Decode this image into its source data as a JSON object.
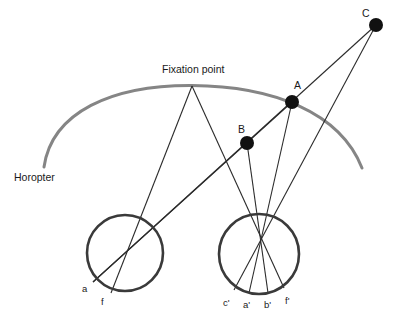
{
  "diagram": {
    "title_labels": {
      "horopter": "Horopter",
      "fixation_point": "Fixation point"
    },
    "object_points": [
      {
        "name": "A",
        "label": "A",
        "x": 292,
        "y": 102,
        "r": 7,
        "label_x": 294,
        "label_y": 89,
        "color": "#111111"
      },
      {
        "name": "B",
        "label": "B",
        "x": 247,
        "y": 143,
        "r": 7,
        "label_x": 238,
        "label_y": 133,
        "color": "#111111"
      },
      {
        "name": "C",
        "label": "C",
        "x": 376,
        "y": 25,
        "r": 7,
        "label_x": 362,
        "label_y": 17,
        "color": "#111111"
      }
    ],
    "retinal_labels_left": [
      {
        "name": "a",
        "label": "a",
        "x": 82,
        "y": 292
      },
      {
        "name": "f",
        "label": "f",
        "x": 101,
        "y": 305
      }
    ],
    "retinal_labels_right": [
      {
        "name": "c-prime",
        "label": "c'",
        "x": 223,
        "y": 306
      },
      {
        "name": "a-prime",
        "label": "a'",
        "x": 243,
        "y": 308
      },
      {
        "name": "b-prime",
        "label": "b'",
        "x": 264,
        "y": 308
      },
      {
        "name": "f-prime",
        "label": "f'",
        "x": 285,
        "y": 304
      }
    ],
    "fixation_label_pos": {
      "x": 162,
      "y": 73
    },
    "horopter_label_pos": {
      "x": 14,
      "y": 181
    },
    "horopter_arc": {
      "path": "M 44,167 C 52,112 112,85 192,85.5 C 272,86 340,112 362,168",
      "color": "#858585",
      "width": 3
    },
    "eyes": [
      {
        "name": "left-eye",
        "cx": 125,
        "cy": 253,
        "r": 38,
        "color": "#3a3a3a",
        "width": 2.6
      },
      {
        "name": "right-eye",
        "cx": 259,
        "cy": 254,
        "r": 40,
        "color": "#3a3a3a",
        "width": 2.6
      }
    ],
    "nodal_points": [
      {
        "name": "left-nodal-point",
        "x": 126,
        "y": 255
      },
      {
        "name": "right-nodal-point",
        "x": 259,
        "y": 256
      }
    ],
    "fixation_point": {
      "x": 192,
      "y": 86
    },
    "rays": [
      {
        "name": "ray-fixation-to-left-eye",
        "x1": 192,
        "y1": 86,
        "x2": 111,
        "y2": 293
      },
      {
        "name": "ray-fixation-to-right-eye",
        "x1": 192,
        "y1": 86,
        "x2": 284,
        "y2": 288
      },
      {
        "name": "ray-A-to-left-eye",
        "x1": 292,
        "y1": 102,
        "x2": 93,
        "y2": 282
      },
      {
        "name": "ray-A-to-right-eye",
        "x1": 292,
        "y1": 102,
        "x2": 249,
        "y2": 293
      },
      {
        "name": "ray-B-to-right-eye",
        "x1": 247,
        "y1": 143,
        "x2": 268,
        "y2": 293
      },
      {
        "name": "ray-C-to-A-and-left-eye",
        "x1": 376,
        "y1": 25,
        "x2": 93,
        "y2": 282
      },
      {
        "name": "ray-C-to-right-eye",
        "x1": 376,
        "y1": 25,
        "x2": 234,
        "y2": 290
      }
    ],
    "line_color": "#2b2b2b",
    "line_width": 1.1
  }
}
